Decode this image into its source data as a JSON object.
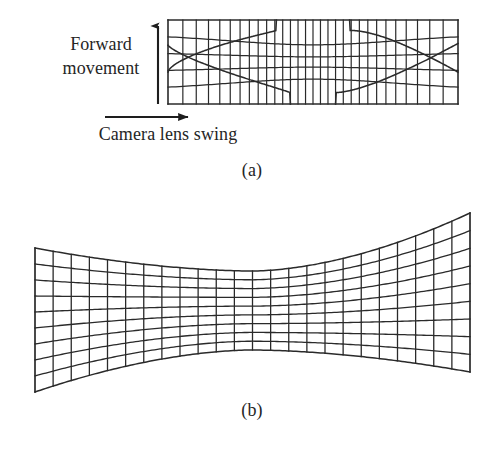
{
  "figure": {
    "background_color": "#ffffff",
    "line_color": "#2a2a2a",
    "text_color": "#252525"
  },
  "labels": {
    "forward_movement": "Forward movement",
    "camera_lens_swing": "Camera lens swing",
    "caption_a": "(a)",
    "caption_b": "(b)"
  },
  "arrows": {
    "vertical": {
      "name": "forward-movement-arrow",
      "direction": "up",
      "x": 158,
      "y_start": 104,
      "y_end": 22
    },
    "horizontal": {
      "name": "camera-lens-swing-arrow",
      "direction": "right",
      "y": 117,
      "x_start": 105,
      "x_end": 196
    }
  },
  "chart_data": {
    "type": "diagram",
    "panels": [
      {
        "id": "a",
        "name": "panel-a-grid",
        "caption": "(a)",
        "description": "Rectangular frame grid with barrel-like horizontal curvature and strong vertical-line compression at the left and right edges",
        "bounds": {
          "x0": 168,
          "y0": 20,
          "x1": 458,
          "y1": 104
        },
        "columns": 30,
        "rows": 5,
        "edge_compression": 0.55,
        "curvature_amplitude": 13
      },
      {
        "id": "b",
        "name": "panel-b-grid",
        "caption": "(b)",
        "description": "Hourglass / bowtie shaped grid, wide at left and right ends, pinched at the centre waist",
        "bounds": {
          "x0": 35,
          "y0": 213,
          "x1": 470,
          "y1": 392
        },
        "columns": 24,
        "rows": 9,
        "left_top_y": 248,
        "left_bottom_y": 392,
        "right_top_y": 213,
        "right_bottom_y": 372,
        "waist_top_y": 271,
        "waist_bottom_y": 350,
        "waist_x": 252
      }
    ]
  }
}
